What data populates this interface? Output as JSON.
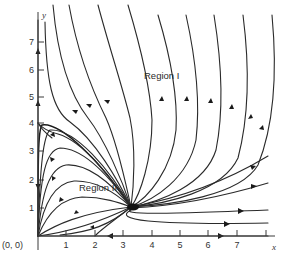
{
  "figure": {
    "type": "phase-portrait",
    "origin_label": "(0, 0)",
    "x_axis": {
      "label": "x",
      "ticks": [
        "1",
        "2",
        "3",
        "4",
        "5",
        "6",
        "7"
      ],
      "range": [
        0,
        8.2
      ]
    },
    "y_axis": {
      "label": "y",
      "ticks": [
        "1",
        "2",
        "3",
        "4",
        "5",
        "6",
        "7"
      ],
      "range": [
        0,
        7.8
      ]
    },
    "regions": [
      {
        "label": "Region I",
        "x": 4.4,
        "y": 5.8
      },
      {
        "label": "Region II",
        "x": 1.45,
        "y": 1.85
      }
    ],
    "equilibria": [
      {
        "name": "stable-node",
        "x": 3.3,
        "y": 1.0
      },
      {
        "name": "saddle-origin",
        "x": 0,
        "y": 0
      },
      {
        "name": "saddle-y-axis",
        "x": 0,
        "y": 4.0
      }
    ],
    "colors": {
      "ink": "#2a2a2a",
      "background": "#ffffff"
    }
  }
}
